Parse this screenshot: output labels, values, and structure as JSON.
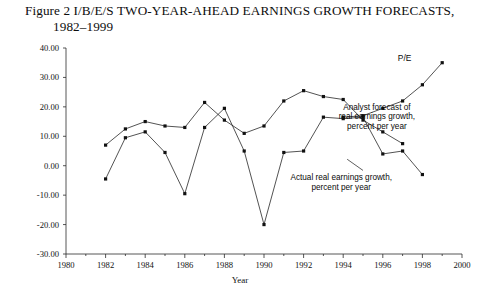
{
  "figure": {
    "title_line1": "Figure 2 I/B/E/S TWO-YEAR-AHEAD EARNINGS GROWTH FORECASTS,",
    "title_line2": "1982–1999"
  },
  "chart_data": {
    "type": "line",
    "title": "Figure 2 I/B/E/S TWO-YEAR-AHEAD EARNINGS GROWTH FORECASTS, 1982–1999",
    "xlabel": "Year",
    "ylabel": "",
    "xlim": [
      1980,
      2000
    ],
    "ylim": [
      -30,
      40
    ],
    "grid": false,
    "legend_position": "inline-annotations",
    "x_tick_labels": [
      "1980",
      "1982",
      "1984",
      "1986",
      "1988",
      "1990",
      "1992",
      "1994",
      "1996",
      "1998",
      "2000"
    ],
    "x_ticks": [
      1980,
      1982,
      1984,
      1986,
      1988,
      1990,
      1992,
      1994,
      1996,
      1998,
      2000
    ],
    "x_minor_ticks": [
      1981,
      1983,
      1985,
      1987,
      1989,
      1991,
      1993,
      1995,
      1997,
      1999
    ],
    "y_tick_labels": [
      "40.00",
      "30.00",
      "20.00",
      "10.00",
      "0.00",
      "-10.00",
      "-20.00",
      "-30.00"
    ],
    "y_ticks": [
      40,
      30,
      20,
      10,
      0,
      -10,
      -20,
      -30
    ],
    "x": [
      1982,
      1983,
      1984,
      1985,
      1986,
      1987,
      1988,
      1989,
      1990,
      1991,
      1992,
      1993,
      1994,
      1995,
      1996,
      1997,
      1998,
      1999
    ],
    "series": [
      {
        "name": "P/E",
        "label": "P/E",
        "values": [
          null,
          null,
          null,
          null,
          null,
          null,
          null,
          null,
          null,
          null,
          null,
          null,
          16.5,
          17.0,
          19.5,
          22.0,
          27.5,
          35.0
        ]
      },
      {
        "name": "Analyst forecast of real earnings growth, percent per year",
        "label": "Analyst forecast of real earnings growth, percent per year",
        "values": [
          7.0,
          12.5,
          15.0,
          13.5,
          13.0,
          21.5,
          15.5,
          11.0,
          13.5,
          22.0,
          25.5,
          23.5,
          22.5,
          15.5,
          11.5,
          7.5,
          null,
          null
        ]
      },
      {
        "name": "Actual real earnings growth, percent per year",
        "label": "Actual real earnings growth, percent per year",
        "values": [
          -4.5,
          9.5,
          11.5,
          4.5,
          -9.5,
          13.0,
          19.5,
          5.0,
          -20.0,
          4.5,
          5.0,
          16.5,
          16.0,
          16.5,
          4.0,
          5.0,
          -3.0,
          null
        ]
      }
    ],
    "annotations": [
      {
        "name": "pe-label",
        "text": "P/E",
        "x": 1997.1,
        "y": 35.5
      },
      {
        "name": "analyst-forecast-annotation",
        "lines": [
          "Analyst forecast of",
          "real earnings growth,",
          "percent per year"
        ],
        "x": 1995.7,
        "y": 19.0
      },
      {
        "name": "actual-growth-annotation",
        "lines": [
          "Actual real earnings growth,",
          "percent per year"
        ],
        "x": 1993.9,
        "y": -5.0
      }
    ]
  }
}
